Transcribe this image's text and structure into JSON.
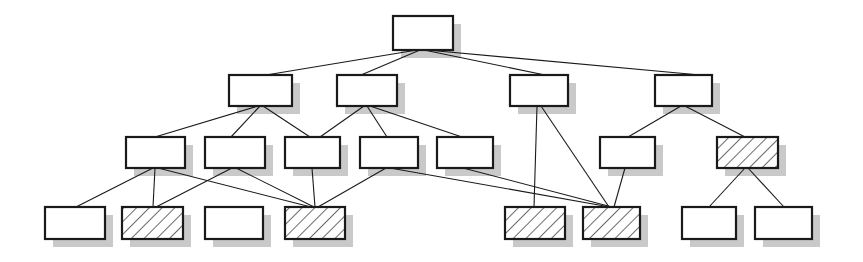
{
  "figure": {
    "kind": "node-link-diagram",
    "title": "",
    "width": 863,
    "height": 262,
    "background_color": "#ffffff"
  },
  "style": {
    "node_stroke_color": "#1a1a1a",
    "node_fill_color": "#ffffff",
    "node_stroke_width": 2.2,
    "hatch_stroke_color": "#1a1a1a",
    "hatch_stroke_width": 1.3,
    "hatch_angle_deg": 45,
    "hatch_spacing": 9,
    "edge_stroke_color": "#1a1a1a",
    "edge_stroke_width": 1.1,
    "shadow_color": "#c9c9c9",
    "shadow_offset_x": 8,
    "shadow_offset_y": 8
  },
  "legend": {
    "plain_meaning": "plain node",
    "hatched_meaning": "hatched node"
  },
  "levels": [
    {
      "index": 0,
      "y": 16,
      "node_ids": [
        "n0"
      ]
    },
    {
      "index": 1,
      "y": 75,
      "node_ids": [
        "n1",
        "n2",
        "n3",
        "n4"
      ]
    },
    {
      "index": 2,
      "y": 137,
      "node_ids": [
        "n5",
        "n6",
        "n7",
        "n8",
        "n9",
        "n10",
        "n11"
      ]
    },
    {
      "index": 3,
      "y": 207,
      "node_ids": [
        "n12",
        "n13",
        "n14",
        "n15",
        "n16",
        "n17",
        "n18",
        "n19"
      ]
    }
  ],
  "nodes": [
    {
      "id": "n0",
      "label": "",
      "level": 0,
      "x": 393,
      "y": 16,
      "w": 60,
      "h": 34,
      "fill": "plain"
    },
    {
      "id": "n1",
      "label": "",
      "level": 1,
      "x": 229,
      "y": 75,
      "w": 63,
      "h": 31,
      "fill": "plain"
    },
    {
      "id": "n2",
      "label": "",
      "level": 1,
      "x": 337,
      "y": 75,
      "w": 60,
      "h": 31,
      "fill": "plain"
    },
    {
      "id": "n3",
      "label": "",
      "level": 1,
      "x": 510,
      "y": 75,
      "w": 58,
      "h": 31,
      "fill": "plain"
    },
    {
      "id": "n4",
      "label": "",
      "level": 1,
      "x": 655,
      "y": 75,
      "w": 57,
      "h": 31,
      "fill": "plain"
    },
    {
      "id": "n5",
      "label": "",
      "level": 2,
      "x": 126,
      "y": 137,
      "w": 59,
      "h": 31,
      "fill": "plain"
    },
    {
      "id": "n6",
      "label": "",
      "level": 2,
      "x": 205,
      "y": 137,
      "w": 60,
      "h": 31,
      "fill": "plain"
    },
    {
      "id": "n7",
      "label": "",
      "level": 2,
      "x": 285,
      "y": 137,
      "w": 55,
      "h": 31,
      "fill": "plain"
    },
    {
      "id": "n8",
      "label": "",
      "level": 2,
      "x": 360,
      "y": 137,
      "w": 58,
      "h": 31,
      "fill": "plain"
    },
    {
      "id": "n9",
      "label": "",
      "level": 2,
      "x": 437,
      "y": 137,
      "w": 56,
      "h": 31,
      "fill": "plain"
    },
    {
      "id": "n10",
      "label": "",
      "level": 2,
      "x": 600,
      "y": 137,
      "w": 55,
      "h": 31,
      "fill": "plain"
    },
    {
      "id": "n11",
      "label": "",
      "level": 2,
      "x": 717,
      "y": 137,
      "w": 61,
      "h": 31,
      "fill": "hatched"
    },
    {
      "id": "n12",
      "label": "",
      "level": 3,
      "x": 45,
      "y": 207,
      "w": 60,
      "h": 32,
      "fill": "plain"
    },
    {
      "id": "n13",
      "label": "",
      "level": 3,
      "x": 122,
      "y": 207,
      "w": 61,
      "h": 32,
      "fill": "hatched"
    },
    {
      "id": "n14",
      "label": "",
      "level": 3,
      "x": 205,
      "y": 207,
      "w": 58,
      "h": 32,
      "fill": "plain"
    },
    {
      "id": "n15",
      "label": "",
      "level": 3,
      "x": 285,
      "y": 207,
      "w": 60,
      "h": 32,
      "fill": "hatched"
    },
    {
      "id": "n16",
      "label": "",
      "level": 3,
      "x": 505,
      "y": 207,
      "w": 60,
      "h": 32,
      "fill": "hatched"
    },
    {
      "id": "n17",
      "label": "",
      "level": 3,
      "x": 583,
      "y": 207,
      "w": 57,
      "h": 32,
      "fill": "hatched"
    },
    {
      "id": "n18",
      "label": "",
      "level": 3,
      "x": 682,
      "y": 207,
      "w": 54,
      "h": 32,
      "fill": "plain"
    },
    {
      "id": "n19",
      "label": "",
      "level": 3,
      "x": 755,
      "y": 207,
      "w": 57,
      "h": 32,
      "fill": "plain"
    }
  ],
  "edges": [
    {
      "from": "n0",
      "to": "n1",
      "x1": 417,
      "y1": 50,
      "x2": 266,
      "y2": 75
    },
    {
      "from": "n0",
      "to": "n2",
      "x1": 420,
      "y1": 50,
      "x2": 361,
      "y2": 75
    },
    {
      "from": "n0",
      "to": "n3",
      "x1": 424,
      "y1": 50,
      "x2": 545,
      "y2": 75
    },
    {
      "from": "n0",
      "to": "n4",
      "x1": 427,
      "y1": 50,
      "x2": 700,
      "y2": 75
    },
    {
      "from": "n1",
      "to": "n5",
      "x1": 258,
      "y1": 106,
      "x2": 155,
      "y2": 137
    },
    {
      "from": "n1",
      "to": "n6",
      "x1": 260,
      "y1": 106,
      "x2": 231,
      "y2": 137
    },
    {
      "from": "n1",
      "to": "n7",
      "x1": 263,
      "y1": 106,
      "x2": 310,
      "y2": 137
    },
    {
      "from": "n2",
      "to": "n7",
      "x1": 364,
      "y1": 106,
      "x2": 320,
      "y2": 137
    },
    {
      "from": "n2",
      "to": "n8",
      "x1": 367,
      "y1": 106,
      "x2": 387,
      "y2": 137
    },
    {
      "from": "n2",
      "to": "n9",
      "x1": 370,
      "y1": 106,
      "x2": 462,
      "y2": 137
    },
    {
      "from": "n3",
      "to": "n16",
      "x1": 537,
      "y1": 106,
      "x2": 534,
      "y2": 207
    },
    {
      "from": "n3",
      "to": "n17",
      "x1": 541,
      "y1": 106,
      "x2": 609,
      "y2": 207
    },
    {
      "from": "n4",
      "to": "n10",
      "x1": 681,
      "y1": 106,
      "x2": 628,
      "y2": 137
    },
    {
      "from": "n4",
      "to": "n11",
      "x1": 685,
      "y1": 106,
      "x2": 745,
      "y2": 137
    },
    {
      "from": "n5",
      "to": "n12",
      "x1": 153,
      "y1": 168,
      "x2": 76,
      "y2": 207
    },
    {
      "from": "n5",
      "to": "n13",
      "x1": 155,
      "y1": 168,
      "x2": 153,
      "y2": 207
    },
    {
      "from": "n5",
      "to": "n15",
      "x1": 158,
      "y1": 168,
      "x2": 311,
      "y2": 207
    },
    {
      "from": "n6",
      "to": "n13",
      "x1": 232,
      "y1": 168,
      "x2": 156,
      "y2": 207
    },
    {
      "from": "n6",
      "to": "n15",
      "x1": 236,
      "y1": 168,
      "x2": 314,
      "y2": 207
    },
    {
      "from": "n7",
      "to": "n15",
      "x1": 312,
      "y1": 168,
      "x2": 315,
      "y2": 207
    },
    {
      "from": "n8",
      "to": "n15",
      "x1": 386,
      "y1": 168,
      "x2": 318,
      "y2": 207
    },
    {
      "from": "n8",
      "to": "n17",
      "x1": 390,
      "y1": 168,
      "x2": 610,
      "y2": 207
    },
    {
      "from": "n9",
      "to": "n17",
      "x1": 463,
      "y1": 168,
      "x2": 612,
      "y2": 207
    },
    {
      "from": "n10",
      "to": "n17",
      "x1": 625,
      "y1": 168,
      "x2": 614,
      "y2": 207
    },
    {
      "from": "n11",
      "to": "n18",
      "x1": 745,
      "y1": 168,
      "x2": 709,
      "y2": 207
    },
    {
      "from": "n11",
      "to": "n19",
      "x1": 748,
      "y1": 168,
      "x2": 784,
      "y2": 207
    }
  ]
}
